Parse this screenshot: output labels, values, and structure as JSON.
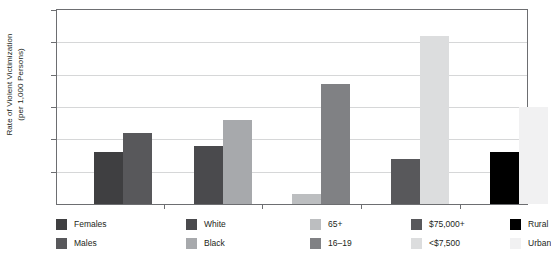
{
  "chart_data": {
    "type": "bar",
    "title": "",
    "xlabel": "",
    "ylabel": "Rate of Violent Victimization (per 1,000 Persons)",
    "ylabel_line1": "Rate of Violent Victimization",
    "ylabel_line2": "(per 1,000 Persons)",
    "ylim": [
      0,
      60
    ],
    "yticks": [
      0,
      10,
      20,
      30,
      40,
      50,
      60
    ],
    "ytick_labels": [
      "0",
      "10",
      "20",
      "30",
      "40",
      "50",
      "60"
    ],
    "grid": true,
    "legend_position": "below-plot",
    "groups": [
      "Sex",
      "Race",
      "Age",
      "Household Income",
      "Location"
    ],
    "categories": [
      "Females",
      "Males",
      "White",
      "Black",
      "65+",
      "16-19",
      "$75,000+",
      "<$7,500",
      "Rural",
      "Urban"
    ],
    "values": [
      16,
      22,
      18,
      26,
      3,
      37,
      14,
      52,
      16,
      30
    ],
    "bars": [
      {
        "label": "Females",
        "value": 16,
        "color": "#3f3f41",
        "group": 0
      },
      {
        "label": "Males",
        "value": 22,
        "color": "#58585b",
        "group": 0
      },
      {
        "label": "White",
        "value": 18,
        "color": "#4a4a4d",
        "group": 1
      },
      {
        "label": "Black",
        "value": 26,
        "color": "#a7a9ac",
        "group": 1
      },
      {
        "label": "65+",
        "value": 3,
        "color": "#bcbec0",
        "group": 2
      },
      {
        "label": "16-19",
        "value": 37,
        "color": "#808184",
        "group": 2
      },
      {
        "label": "$75,000+",
        "value": 14,
        "color": "#58585b",
        "group": 3
      },
      {
        "label": "<$7,500",
        "value": 52,
        "color": "#dcddde",
        "group": 3
      },
      {
        "label": "Rural",
        "value": 16,
        "color": "#000000",
        "group": 4
      },
      {
        "label": "Urban",
        "value": 30,
        "color": "#f1f1f2",
        "group": 4
      }
    ],
    "legend": [
      {
        "label": "Females",
        "color": "#3f3f41"
      },
      {
        "label": "Males",
        "color": "#58585b"
      },
      {
        "label": "White",
        "color": "#4a4a4d"
      },
      {
        "label": "Black",
        "color": "#a7a9ac"
      },
      {
        "label": "65+",
        "color": "#bcbec0"
      },
      {
        "label": "16–19",
        "color": "#808184"
      },
      {
        "label": "$75,000+",
        "color": "#58585b"
      },
      {
        "label": "<$7,500",
        "color": "#dcddde"
      },
      {
        "label": "Rural",
        "color": "#000000"
      },
      {
        "label": "Urban",
        "color": "#f1f1f2"
      }
    ],
    "colors": {
      "axis": "#6d6e71",
      "gridline": "#d6d7d8",
      "text": "#231f20",
      "background": "#ffffff"
    }
  }
}
